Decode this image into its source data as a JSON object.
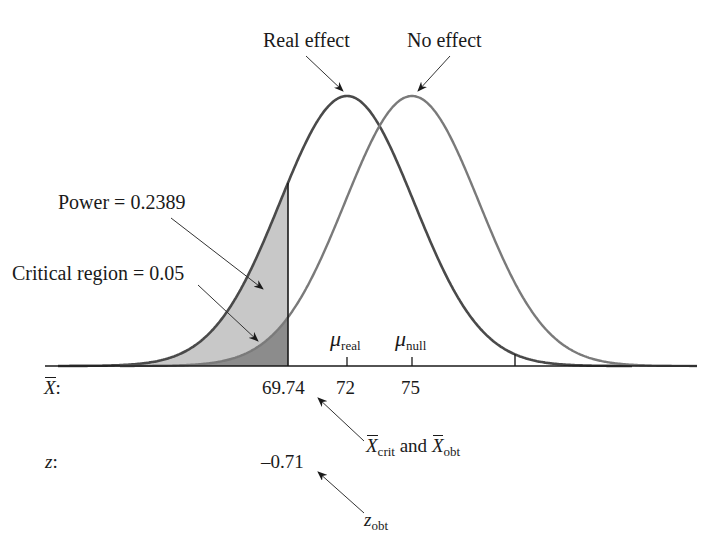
{
  "labels": {
    "real_effect": "Real effect",
    "no_effect": "No effect",
    "power": "Power = 0.2389",
    "critical_region": "Critical region = 0.05",
    "mu_symbol": "μ",
    "mu_real_sub": "real",
    "mu_null_sub": "null",
    "xbar_axis": "X",
    "xbar_axis_suffix": ":",
    "z_axis": "z",
    "z_axis_suffix": ":",
    "xbar_values": [
      "69.74",
      "72",
      "75"
    ],
    "z_value": "–0.71",
    "xcrit_label_x": "X",
    "xcrit_sub": "crit",
    "and": " and ",
    "xobt_label_x": "X",
    "xobt_sub": "obt",
    "zobt": "z",
    "zobt_sub": "obt"
  },
  "chart_data": {
    "type": "area",
    "title": "",
    "series": [
      {
        "name": "Real effect",
        "mean": 72,
        "shaded_region": "X ≤ 69.74",
        "shaded_area": 0.2389,
        "shaded_label": "Power"
      },
      {
        "name": "No effect",
        "mean": 75,
        "shaded_region": "X ≤ 69.74",
        "shaded_area": 0.05,
        "shaded_label": "Critical region"
      }
    ],
    "x_axis": {
      "label": "X̄",
      "ticks": [
        69.74,
        72,
        75
      ]
    },
    "z_axis": {
      "label": "z",
      "ticks": [
        -0.71
      ]
    },
    "annotations": [
      {
        "text": "X̄crit and X̄obt",
        "points_to": 69.74
      },
      {
        "text": "zobt",
        "points_to": -0.71
      },
      {
        "text": "μreal",
        "at": 72
      },
      {
        "text": "μnull",
        "at": 75
      }
    ],
    "grid": false,
    "legend": "none"
  },
  "colors": {
    "curve_real": "#4a4a4a",
    "curve_null": "#7a7a7a",
    "power_fill": "#c8c8c8",
    "critical_fill": "#8c8c8c",
    "axis": "#1a1a1a"
  }
}
